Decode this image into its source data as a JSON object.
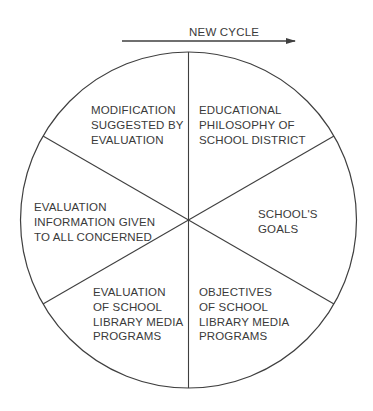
{
  "diagram": {
    "arrow_label": "NEW CYCLE",
    "line_color": "#3f3f3f",
    "text_color": "#3a3a3a",
    "segments": [
      {
        "id": "educational-philosophy",
        "position": "top-right",
        "lines": [
          "EDUCATIONAL",
          "PHILOSOPHY OF",
          "SCHOOL DISTRICT"
        ]
      },
      {
        "id": "schools-goals",
        "position": "right",
        "lines": [
          "SCHOOL'S",
          "GOALS"
        ]
      },
      {
        "id": "objectives",
        "position": "bottom-right",
        "lines": [
          "OBJECTIVES",
          "OF SCHOOL",
          "LIBRARY MEDIA",
          "PROGRAMS"
        ]
      },
      {
        "id": "evaluation-programs",
        "position": "bottom-left",
        "lines": [
          "EVALUATION",
          "OF SCHOOL",
          "LIBRARY MEDIA",
          "PROGRAMS"
        ]
      },
      {
        "id": "evaluation-information",
        "position": "left",
        "lines": [
          "EVALUATION",
          "INFORMATION GIVEN",
          "TO ALL CONCERNED"
        ]
      },
      {
        "id": "modification",
        "position": "top-left",
        "lines": [
          "MODIFICATION",
          "SUGGESTED BY",
          "EVALUATION"
        ]
      }
    ],
    "flow_order": [
      "educational-philosophy",
      "schools-goals",
      "objectives",
      "evaluation-programs",
      "evaluation-information",
      "modification"
    ]
  }
}
